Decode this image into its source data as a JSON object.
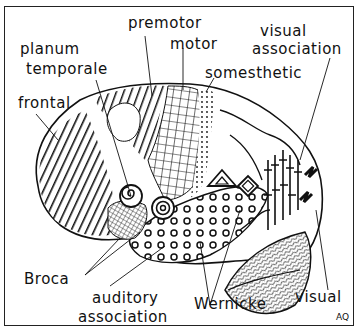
{
  "diagram": {
    "labels": {
      "premotor": "premotor",
      "motor": "motor",
      "planum_temporale_1": "planum",
      "planum_temporale_2": "temporale",
      "frontal": "frontal",
      "somesthetic": "somesthetic",
      "visual_association_1": "visual",
      "visual_association_2": "association",
      "broca": "Broca",
      "auditory_association_1": "auditory",
      "auditory_association_2": "association",
      "wernicke": "Wernicke",
      "visual": "visual"
    },
    "signature": "AQ",
    "colors": {
      "ink": "#111111",
      "paper": "#ffffff"
    }
  }
}
